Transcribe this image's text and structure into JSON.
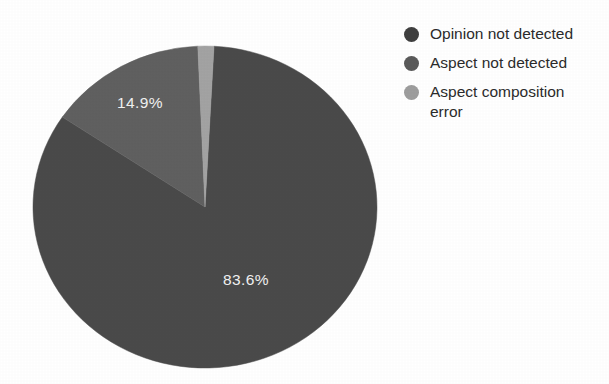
{
  "chart_data": {
    "type": "pie",
    "title": "",
    "subtitle": "",
    "xlabel": "",
    "ylabel": "",
    "grid": false,
    "legend_position": "right",
    "start_angle_deg": 3,
    "direction": "clockwise",
    "categories": [
      "Opinion not detected",
      "Aspect not detected",
      "Aspect composition error"
    ],
    "values": [
      83.6,
      14.9,
      1.5
    ],
    "labels": [
      "83.6%",
      "14.9%",
      ""
    ],
    "colors": [
      "#4a4a4a",
      "#606060",
      "#a3a3a3"
    ],
    "slices": [
      {
        "name": "Opinion not detected",
        "value": 83.6,
        "label": "83.6%",
        "color": "#4a4a4a",
        "label_x": 246,
        "label_y": 285
      },
      {
        "name": "Aspect not detected",
        "value": 14.9,
        "label": "14.9%",
        "color": "#606060",
        "label_x": 140,
        "label_y": 108
      },
      {
        "name": "Aspect composition error",
        "value": 1.5,
        "label": "",
        "color": "#a3a3a3",
        "label_x": 0,
        "label_y": 0
      }
    ]
  },
  "legend": {
    "items": [
      {
        "label": "Opinion not detected",
        "color": "#3f3f3f"
      },
      {
        "label": "Aspect not detected",
        "color": "#5a5a5a"
      },
      {
        "label": "Aspect composition error",
        "color": "#9d9d9d"
      }
    ]
  },
  "geometry": {
    "center_x": 205,
    "center_y": 207,
    "radius_x": 172,
    "radius_y": 161
  }
}
